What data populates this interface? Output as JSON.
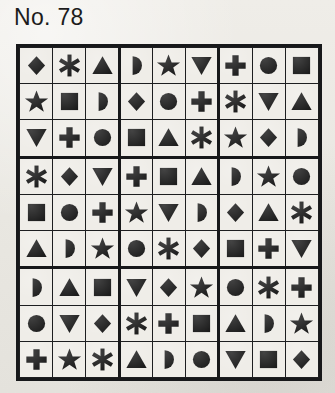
{
  "page": {
    "title": "No. 78",
    "background_color": "#eceae5",
    "ink_color": "#1b1b1b"
  },
  "puzzle": {
    "type": "symbol-sudoku",
    "rows": 9,
    "columns": 9,
    "box_rows": 3,
    "box_columns": 3,
    "symbol_names": [
      "diamond",
      "asterisk",
      "triangle-up",
      "half-circle",
      "star",
      "triangle-down",
      "plus",
      "circle",
      "square"
    ],
    "cells": [
      [
        "diamond",
        "asterisk",
        "triangle-up",
        "half-circle",
        "star",
        "triangle-down",
        "plus",
        "circle",
        "square"
      ],
      [
        "star",
        "square",
        "half-circle",
        "diamond",
        "circle",
        "plus",
        "asterisk",
        "triangle-down",
        "triangle-up"
      ],
      [
        "triangle-down",
        "plus",
        "circle",
        "square",
        "triangle-up",
        "asterisk",
        "star",
        "diamond",
        "half-circle"
      ],
      [
        "asterisk",
        "diamond",
        "triangle-down",
        "plus",
        "square",
        "triangle-up",
        "half-circle",
        "star",
        "circle"
      ],
      [
        "square",
        "circle",
        "plus",
        "star",
        "triangle-down",
        "half-circle",
        "diamond",
        "triangle-up",
        "asterisk"
      ],
      [
        "triangle-up",
        "half-circle",
        "star",
        "circle",
        "asterisk",
        "diamond",
        "square",
        "plus",
        "triangle-down"
      ],
      [
        "half-circle",
        "triangle-up",
        "square",
        "triangle-down",
        "diamond",
        "star",
        "circle",
        "asterisk",
        "plus"
      ],
      [
        "circle",
        "triangle-down",
        "diamond",
        "asterisk",
        "plus",
        "square",
        "triangle-up",
        "half-circle",
        "star"
      ],
      [
        "plus",
        "star",
        "asterisk",
        "triangle-up",
        "half-circle",
        "circle",
        "triangle-down",
        "square",
        "diamond"
      ]
    ]
  }
}
